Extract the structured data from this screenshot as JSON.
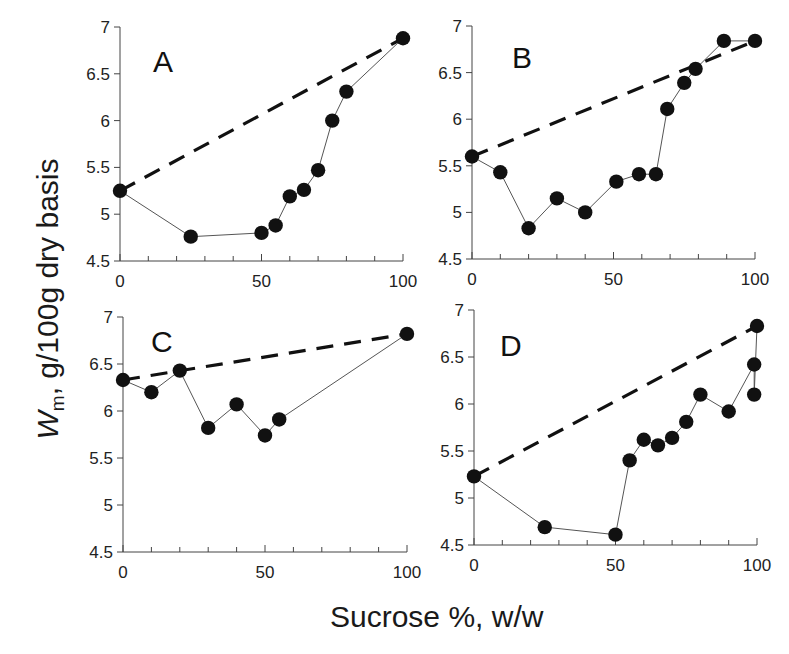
{
  "figure": {
    "ylabel_main": "W",
    "ylabel_sub": "m",
    "ylabel_rest": ", g/100g dry basis",
    "xlabel": "Sucrose %, w/w",
    "yticks": [
      "4.5",
      "5",
      "5.5",
      "6",
      "6.5",
      "7"
    ],
    "xticks": [
      "0",
      "50",
      "100"
    ],
    "colors": {
      "points": "#111111",
      "line": "#555555",
      "dash": "#111111",
      "axis": "#444444"
    }
  },
  "chart_data": [
    {
      "type": "scatter",
      "panel": "A",
      "title": "A",
      "xlabel": "Sucrose %, w/w",
      "ylabel": "Wm, g/100g dry basis",
      "xlim": [
        0,
        100
      ],
      "ylim": [
        4.5,
        7
      ],
      "series": [
        {
          "name": "measured",
          "style": "line+markers",
          "x": [
            0,
            25,
            50,
            55,
            60,
            65,
            70,
            75,
            80,
            100
          ],
          "y": [
            5.25,
            4.76,
            4.8,
            4.88,
            5.19,
            5.26,
            5.47,
            6.0,
            6.31,
            6.88
          ]
        },
        {
          "name": "ideal (linear mixing)",
          "style": "dashed",
          "x": [
            0,
            100
          ],
          "y": [
            5.25,
            6.88
          ]
        }
      ]
    },
    {
      "type": "scatter",
      "panel": "B",
      "title": "B",
      "xlabel": "Sucrose %, w/w",
      "ylabel": "Wm, g/100g dry basis",
      "xlim": [
        0,
        100
      ],
      "ylim": [
        4.5,
        7
      ],
      "series": [
        {
          "name": "measured",
          "style": "line+markers",
          "x": [
            0,
            10,
            20,
            30,
            40,
            51,
            59,
            65,
            69,
            75,
            79,
            89,
            100
          ],
          "y": [
            5.6,
            5.43,
            4.83,
            5.15,
            5.0,
            5.33,
            5.41,
            5.41,
            6.11,
            6.39,
            6.54,
            6.84,
            6.84
          ]
        },
        {
          "name": "ideal (linear mixing)",
          "style": "dashed",
          "x": [
            0,
            100
          ],
          "y": [
            5.6,
            6.84
          ]
        }
      ]
    },
    {
      "type": "scatter",
      "panel": "C",
      "title": "C",
      "xlabel": "Sucrose %, w/w",
      "ylabel": "Wm, g/100g dry basis",
      "xlim": [
        0,
        100
      ],
      "ylim": [
        4.5,
        7
      ],
      "series": [
        {
          "name": "measured",
          "style": "line+markers",
          "x": [
            0,
            10,
            20,
            30,
            40,
            50,
            55,
            100
          ],
          "y": [
            6.33,
            6.2,
            6.43,
            5.82,
            6.07,
            5.74,
            5.91,
            6.82
          ]
        },
        {
          "name": "ideal (linear mixing)",
          "style": "dashed",
          "x": [
            0,
            100
          ],
          "y": [
            6.33,
            6.82
          ]
        }
      ]
    },
    {
      "type": "scatter",
      "panel": "D",
      "title": "D",
      "xlabel": "Sucrose %, w/w",
      "ylabel": "Wm, g/100g dry basis",
      "xlim": [
        0,
        100
      ],
      "ylim": [
        4.5,
        7
      ],
      "series": [
        {
          "name": "measured",
          "style": "line+markers",
          "x": [
            0,
            25,
            50,
            55,
            60,
            65,
            70,
            75,
            80,
            90,
            99,
            99,
            100
          ],
          "y": [
            5.23,
            4.69,
            4.61,
            5.4,
            5.62,
            5.56,
            5.64,
            5.81,
            6.1,
            5.92,
            6.42,
            6.1,
            6.83
          ]
        },
        {
          "name": "ideal (linear mixing)",
          "style": "dashed",
          "x": [
            0,
            100
          ],
          "y": [
            5.23,
            6.83
          ]
        }
      ]
    }
  ]
}
